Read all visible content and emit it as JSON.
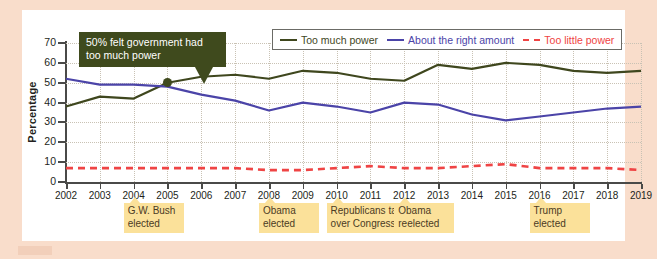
{
  "chart_data": {
    "type": "line",
    "title": "",
    "xlabel": "",
    "ylabel": "Percentage",
    "xlim": [
      2002,
      2019
    ],
    "ylim": [
      0,
      70
    ],
    "ytick_step": 10,
    "grid": true,
    "legend_position": "top-right",
    "categories": [
      2002,
      2003,
      2004,
      2005,
      2006,
      2007,
      2008,
      2009,
      2010,
      2011,
      2012,
      2013,
      2014,
      2015,
      2016,
      2017,
      2018,
      2019
    ],
    "series": [
      {
        "name": "Too much power",
        "color": "#3f471e",
        "style": "solid",
        "values": [
          38,
          43,
          42,
          50,
          53,
          54,
          52,
          56,
          55,
          52,
          51,
          59,
          57,
          60,
          59,
          56,
          55,
          56
        ]
      },
      {
        "name": "About the right amount",
        "color": "#4b44a8",
        "style": "solid",
        "values": [
          52,
          49,
          49,
          48,
          44,
          41,
          36,
          40,
          38,
          35,
          40,
          39,
          34,
          31,
          33,
          35,
          37,
          38
        ]
      },
      {
        "name": "Too little power",
        "color": "#ef4444",
        "style": "dashed",
        "values": [
          7,
          7,
          7,
          7,
          7,
          7,
          6,
          6,
          7,
          8,
          7,
          7,
          8,
          9,
          7,
          7,
          7,
          6
        ]
      }
    ],
    "annotations": [
      {
        "id": "callout-50pct",
        "text": "50% felt government had too much power",
        "points_to_year": 2005,
        "points_to_value": 50,
        "background": "#3f4a1d",
        "text_color": "#ffffff"
      }
    ],
    "event_notes": [
      {
        "id": "gw-bush-elected",
        "label": "G.W. Bush\nelected",
        "year": 2004
      },
      {
        "id": "obama-elected",
        "label": "Obama\nelected",
        "year": 2008
      },
      {
        "id": "republicans-congress",
        "label": "Republicans take\nover Congress",
        "year": 2010
      },
      {
        "id": "obama-reelected",
        "label": "Obama\nreelected",
        "year": 2012
      },
      {
        "id": "trump-elected",
        "label": "Trump\nelected",
        "year": 2016
      }
    ]
  },
  "legend": {
    "items": [
      {
        "label": "Too much power",
        "color": "#3f471e"
      },
      {
        "label": "About the right amount",
        "color": "#4b44a8"
      },
      {
        "label": "Too little power",
        "color": "#ef4444"
      }
    ]
  },
  "axis": {
    "y_title": "Percentage",
    "y_ticks": [
      "70",
      "60",
      "50",
      "40",
      "30",
      "20",
      "10",
      "0"
    ],
    "x_ticks": [
      "2002",
      "2003",
      "2004",
      "2005",
      "2006",
      "2007",
      "2008",
      "2009",
      "2010",
      "2011",
      "2012",
      "2013",
      "2014",
      "2015",
      "2016",
      "2017",
      "2018",
      "2019"
    ]
  },
  "colors": {
    "page_background": "#f9ddcb",
    "panel_background": "#ffffff",
    "grid": "#c9c2b4",
    "axis": "#4a4a48",
    "note_background": "#fbe19a",
    "callout_background": "#3f4a1d"
  }
}
